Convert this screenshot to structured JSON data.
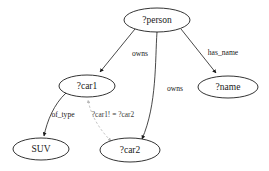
{
  "diagram": {
    "type": "directed-graph",
    "background_color": "#ffffff",
    "node_stroke_color": "#000000",
    "edge_color": "#1a1a1a",
    "constraint_edge_color": "#b8b8b8",
    "nodes": [
      {
        "id": "person",
        "label": "?person",
        "cx": 157,
        "cy": 20,
        "rx": 33,
        "ry": 12
      },
      {
        "id": "car1",
        "label": "?car1",
        "cx": 87,
        "cy": 86,
        "rx": 28,
        "ry": 11
      },
      {
        "id": "name",
        "label": "?name",
        "cx": 228,
        "cy": 87,
        "rx": 30,
        "ry": 11
      },
      {
        "id": "suv",
        "label": "SUV",
        "cx": 41,
        "cy": 149,
        "rx": 28,
        "ry": 11
      },
      {
        "id": "car2",
        "label": "?car2",
        "cx": 130,
        "cy": 150,
        "rx": 30,
        "ry": 12
      }
    ],
    "edges": [
      {
        "id": "person-owns-car1",
        "from": "person",
        "to": "car1",
        "label": "owns",
        "label_x": 140,
        "label_y": 54,
        "style": "solid",
        "arrow": "single"
      },
      {
        "id": "person-owns-car2",
        "from": "person",
        "to": "car2",
        "label": "owns",
        "label_x": 175,
        "label_y": 89,
        "style": "solid",
        "arrow": "single"
      },
      {
        "id": "person-has_name-name",
        "from": "person",
        "to": "name",
        "label": "has_name",
        "label_x": 223,
        "label_y": 53,
        "style": "solid",
        "arrow": "single"
      },
      {
        "id": "car1-of_type-suv",
        "from": "car1",
        "to": "suv",
        "label": "of_type",
        "label_x": 63,
        "label_y": 115,
        "style": "solid",
        "arrow": "single"
      },
      {
        "id": "car1-notequal-car2",
        "from": "car2",
        "to": "car1",
        "label": "?car1! = ?car2",
        "label_x": 113,
        "label_y": 115,
        "style": "dashed",
        "arrow": "double"
      }
    ]
  }
}
